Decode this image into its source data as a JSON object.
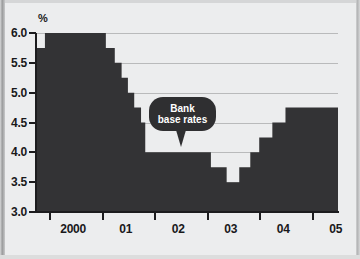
{
  "chart_data": {
    "type": "area",
    "title": "",
    "subtitle": "",
    "xlabel": "",
    "ylabel": "%",
    "unit_label": "%",
    "ylim": [
      3.0,
      6.0
    ],
    "xlim": [
      1999.75,
      2005.5
    ],
    "grid": true,
    "legend_position": "none",
    "y_ticks": [
      "6.0",
      "5.5",
      "5.0",
      "4.5",
      "4.0",
      "3.5",
      "3.0"
    ],
    "y_tick_values": [
      6.0,
      5.5,
      5.0,
      4.5,
      4.0,
      3.5,
      3.0
    ],
    "x_ticks": [
      "2000",
      "01",
      "02",
      "03",
      "04",
      "05"
    ],
    "x_tick_values": [
      2000,
      2001,
      2002,
      2003,
      2004,
      2005
    ],
    "series": [
      {
        "name": "Bank base rates",
        "color": "#333335",
        "style": "step",
        "points": [
          {
            "x": 1999.75,
            "y": 5.75
          },
          {
            "x": 1999.92,
            "y": 6.0
          },
          {
            "x": 2000.92,
            "y": 6.0
          },
          {
            "x": 2001.08,
            "y": 5.75
          },
          {
            "x": 2001.25,
            "y": 5.5
          },
          {
            "x": 2001.38,
            "y": 5.25
          },
          {
            "x": 2001.5,
            "y": 5.0
          },
          {
            "x": 2001.62,
            "y": 4.75
          },
          {
            "x": 2001.75,
            "y": 4.5
          },
          {
            "x": 2001.83,
            "y": 4.0
          },
          {
            "x": 2002.92,
            "y": 4.0
          },
          {
            "x": 2003.08,
            "y": 3.75
          },
          {
            "x": 2003.38,
            "y": 3.5
          },
          {
            "x": 2003.62,
            "y": 3.75
          },
          {
            "x": 2003.83,
            "y": 4.0
          },
          {
            "x": 2004.0,
            "y": 4.25
          },
          {
            "x": 2004.25,
            "y": 4.5
          },
          {
            "x": 2004.5,
            "y": 4.75
          },
          {
            "x": 2005.25,
            "y": 4.75
          },
          {
            "x": 2005.5,
            "y": 4.5
          }
        ]
      }
    ],
    "annotations": [
      {
        "name": "bank-base-rates-callout",
        "line1": "Bank",
        "line2": "base rates",
        "text": "Bank base rates",
        "target_x": 2001.85,
        "target_y": 4.0
      }
    ]
  },
  "colors": {
    "series_fill": "#333335",
    "background": "#ecedee",
    "gridline": "#b9babb",
    "axis": "#1c1c1e",
    "callout_bg": "#2f2f31",
    "callout_text": "#ffffff"
  }
}
